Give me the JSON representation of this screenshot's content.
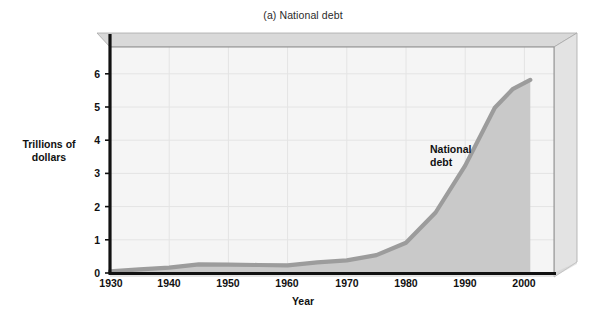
{
  "figure": {
    "title": "(a) National debt",
    "xlabel": "Year",
    "ylabel_line1": "Trillions of",
    "ylabel_line2": "dollars",
    "annotation_line1": "National",
    "annotation_line2": "debt",
    "colors": {
      "area_fill": "#c9c9c9",
      "line": "#9a9a9a",
      "plot_background": "#f4f4f4",
      "slab_top": "#d8d8d8",
      "slab_side": "#e2e2e2",
      "axis": "#111111",
      "gridline": "#e6e6e6",
      "text": "#111111"
    }
  },
  "chart_data": {
    "type": "area",
    "title": "(a) National debt",
    "xlabel": "Year",
    "ylabel": "Trillions of dollars",
    "xlim": [
      1930,
      2005
    ],
    "ylim": [
      0,
      6.8
    ],
    "xticks": [
      1930,
      1940,
      1950,
      1960,
      1970,
      1980,
      1990,
      2000
    ],
    "xtick_labels": [
      "1930",
      "1940",
      "1950",
      "1960",
      "1970",
      "1980",
      "1990",
      "2000"
    ],
    "yticks": [
      0,
      1,
      2,
      3,
      4,
      5,
      6
    ],
    "ytick_labels": [
      "0",
      "1",
      "2",
      "3",
      "4",
      "5",
      "6"
    ],
    "grid": true,
    "legend": "none",
    "annotations": [
      {
        "text": "National debt",
        "x": 1988,
        "y": 3.6
      }
    ],
    "series": [
      {
        "name": "National debt",
        "x": [
          1930,
          1935,
          1940,
          1945,
          1950,
          1955,
          1960,
          1965,
          1970,
          1975,
          1980,
          1985,
          1990,
          1995,
          1998,
          2001
        ],
        "values": [
          0.05,
          0.11,
          0.16,
          0.26,
          0.25,
          0.24,
          0.23,
          0.32,
          0.38,
          0.54,
          0.91,
          1.82,
          3.23,
          4.97,
          5.53,
          5.81
        ]
      }
    ]
  }
}
